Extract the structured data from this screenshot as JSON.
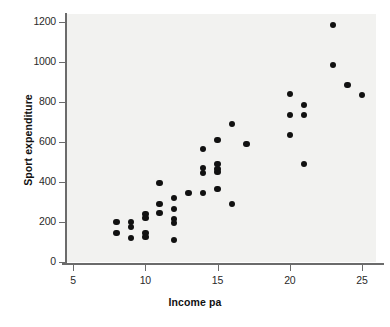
{
  "chart_data": {
    "type": "scatter",
    "title": "",
    "xlabel": "Income pa",
    "ylabel": "Sport expenditure",
    "xlim": [
      3.6,
      25.5
    ],
    "ylim": [
      -70,
      1250
    ],
    "xticks": [
      5,
      10,
      15,
      20,
      25
    ],
    "yticks": [
      0,
      200,
      400,
      600,
      800,
      1000,
      1200
    ],
    "xtick_labels": [
      "5",
      "10",
      "15",
      "20",
      "25"
    ],
    "ytick_labels": [
      "0",
      "200",
      "400",
      "600",
      "800",
      "1000",
      "1200"
    ],
    "grid": false,
    "legend": null,
    "marker": "filled-circle",
    "marker_color": "#111111",
    "plot_background": "#f2f2f0",
    "points": [
      {
        "x": 8,
        "y": 200
      },
      {
        "x": 8,
        "y": 145
      },
      {
        "x": 9,
        "y": 200
      },
      {
        "x": 9,
        "y": 175
      },
      {
        "x": 9,
        "y": 120
      },
      {
        "x": 10,
        "y": 240
      },
      {
        "x": 10,
        "y": 220
      },
      {
        "x": 10,
        "y": 145
      },
      {
        "x": 10,
        "y": 125
      },
      {
        "x": 11,
        "y": 395
      },
      {
        "x": 11,
        "y": 290
      },
      {
        "x": 11,
        "y": 245
      },
      {
        "x": 12,
        "y": 320
      },
      {
        "x": 12,
        "y": 265
      },
      {
        "x": 12,
        "y": 215
      },
      {
        "x": 12,
        "y": 195
      },
      {
        "x": 12,
        "y": 110
      },
      {
        "x": 13,
        "y": 345
      },
      {
        "x": 14,
        "y": 565
      },
      {
        "x": 14,
        "y": 470
      },
      {
        "x": 14,
        "y": 445
      },
      {
        "x": 14,
        "y": 345
      },
      {
        "x": 15,
        "y": 610
      },
      {
        "x": 15,
        "y": 490
      },
      {
        "x": 15,
        "y": 465
      },
      {
        "x": 15,
        "y": 450
      },
      {
        "x": 15,
        "y": 365
      },
      {
        "x": 16,
        "y": 690
      },
      {
        "x": 16,
        "y": 290
      },
      {
        "x": 17,
        "y": 590
      },
      {
        "x": 20,
        "y": 840
      },
      {
        "x": 20,
        "y": 735
      },
      {
        "x": 20,
        "y": 635
      },
      {
        "x": 21,
        "y": 785
      },
      {
        "x": 21,
        "y": 735
      },
      {
        "x": 21,
        "y": 490
      },
      {
        "x": 23,
        "y": 1185
      },
      {
        "x": 23,
        "y": 985
      },
      {
        "x": 24,
        "y": 885
      },
      {
        "x": 25,
        "y": 835
      }
    ]
  }
}
